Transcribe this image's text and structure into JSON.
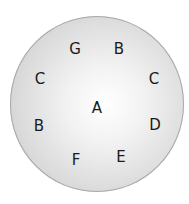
{
  "diagram": {
    "center_label": "A",
    "ring_labels": [
      {
        "id": "top-left",
        "text": "G",
        "x": 75,
        "y": 49
      },
      {
        "id": "top-right",
        "text": "B",
        "x": 119,
        "y": 49
      },
      {
        "id": "upper-right",
        "text": "C",
        "x": 154,
        "y": 79
      },
      {
        "id": "lower-right",
        "text": "D",
        "x": 155,
        "y": 125
      },
      {
        "id": "bottom-right",
        "text": "E",
        "x": 121,
        "y": 157
      },
      {
        "id": "bottom-left",
        "text": "F",
        "x": 76,
        "y": 160
      },
      {
        "id": "lower-left",
        "text": "B",
        "x": 39,
        "y": 126
      },
      {
        "id": "upper-left",
        "text": "C",
        "x": 40,
        "y": 79
      }
    ],
    "colors": {
      "disc_edge": "#c4c4c4",
      "disc_center": "#ffffff",
      "text": "#1a1a1a"
    }
  }
}
